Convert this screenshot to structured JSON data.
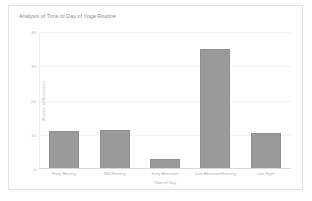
{
  "card": {
    "background": "#fefefe",
    "border_color": "#e2e2e2"
  },
  "chart_data": {
    "type": "bar",
    "title": "Analysis of Time of Day of Yoga Routine",
    "xlabel": "Time of Day",
    "ylabel": "Number of Responses",
    "categories": [
      "Early Morning",
      "Mid Morning",
      "Early Afternoon",
      "Late Afternoon/Evening",
      "Late Night"
    ],
    "values": [
      11,
      11.5,
      3,
      35,
      10.5
    ],
    "ylim": [
      0,
      40
    ],
    "yticks": [
      0,
      10,
      20,
      30,
      40
    ],
    "ytick_labels": [
      "0",
      "10",
      "20",
      "30",
      "40"
    ],
    "grid": true,
    "legend": false,
    "bar_color": "#9a9a9a",
    "bar_border_color": "#8f8f8f"
  }
}
